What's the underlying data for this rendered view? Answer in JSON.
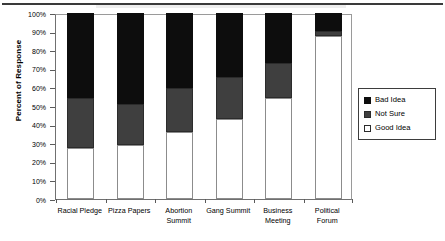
{
  "chart_data": {
    "type": "bar",
    "subtype": "stacked-100-percent",
    "title": "",
    "xlabel": "",
    "ylabel": "Percent of Response",
    "ylim": [
      0,
      100
    ],
    "ytick_labels": [
      "0%",
      "10%",
      "20%",
      "30%",
      "40%",
      "50%",
      "60%",
      "70%",
      "80%",
      "90%",
      "100%"
    ],
    "ytick_values": [
      0,
      10,
      20,
      30,
      40,
      50,
      60,
      70,
      80,
      90,
      100
    ],
    "grid": false,
    "legend_position": "right",
    "categories": [
      "Racial Pledge",
      "Pizza Papers",
      "Abortion Summit",
      "Gang Summit",
      "Business Meeting",
      "Political Forum"
    ],
    "category_lines": [
      [
        "Racial Pledge"
      ],
      [
        "Pizza Papers"
      ],
      [
        "Abortion",
        "Summit"
      ],
      [
        "Gang Summit"
      ],
      [
        "Business",
        "Meeting"
      ],
      [
        "Political",
        "Forum"
      ]
    ],
    "series": [
      {
        "name": "Good Idea",
        "color": "#ffffff",
        "values": [
          27.5,
          29.0,
          36.0,
          43.0,
          54.5,
          87.5
        ]
      },
      {
        "name": "Not Sure",
        "color": "#3f3f3f",
        "values": [
          27.0,
          22.0,
          23.5,
          22.5,
          18.5,
          3.0
        ]
      },
      {
        "name": "Bad Idea",
        "color": "#0d0d0d",
        "values": [
          45.5,
          49.0,
          40.5,
          34.5,
          27.0,
          9.5
        ]
      }
    ],
    "stack_order_bottom_to_top": [
      "Good Idea",
      "Not Sure",
      "Bad Idea"
    ]
  },
  "legend": {
    "items": [
      {
        "label": "Bad Idea",
        "swatch": "filled-black-square"
      },
      {
        "label": "Not Sure",
        "swatch": "filled-gray-square"
      },
      {
        "label": "Good Idea",
        "swatch": "outlined-white-square"
      }
    ]
  },
  "colors": {
    "bad_idea": "#0d0d0d",
    "not_sure": "#3f3f3f",
    "good_idea": "#ffffff",
    "axis": "#5a5a5a",
    "frame": "#9a9a9a"
  }
}
